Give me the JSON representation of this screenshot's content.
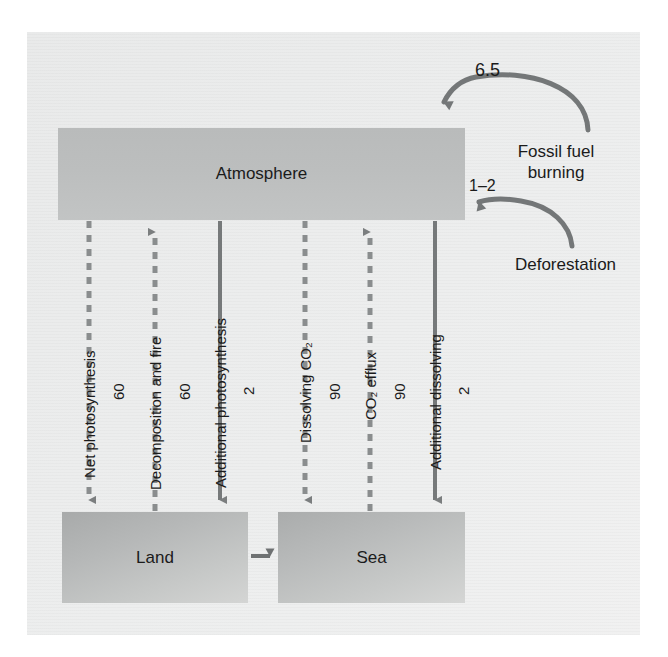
{
  "figure": {
    "type": "carbon-cycle-diagram",
    "background_color": "#eceded",
    "ink_color": "#6e7172",
    "text_color": "#1b1b1b"
  },
  "reservoirs": [
    {
      "id": "atmosphere",
      "label": "Atmosphere",
      "fill": "#bcbebe"
    },
    {
      "id": "land",
      "label": "Land",
      "fill": "#b8baba"
    },
    {
      "id": "sea",
      "label": "Sea",
      "fill": "#babcbc"
    }
  ],
  "flows": [
    {
      "id": "net-photosynthesis",
      "label": "Net photosynthesis",
      "value": "60",
      "direction": "down",
      "style": "dashed",
      "from": "atmosphere",
      "to": "land"
    },
    {
      "id": "decomposition-and-fire",
      "label": "Decomposition and fire",
      "value": "60",
      "direction": "up",
      "style": "dashed",
      "from": "land",
      "to": "atmosphere"
    },
    {
      "id": "additional-photosynthesis",
      "label": "Additional photosynthesis",
      "value": "2",
      "direction": "down",
      "style": "solid",
      "from": "atmosphere",
      "to": "land"
    },
    {
      "id": "dissolving-co2",
      "label": "Dissolving CO₂",
      "value": "90",
      "direction": "down",
      "style": "dashed",
      "from": "atmosphere",
      "to": "sea"
    },
    {
      "id": "co2-efflux",
      "label": "CO₂ efflux",
      "value": "90",
      "direction": "up",
      "style": "dashed",
      "from": "sea",
      "to": "atmosphere"
    },
    {
      "id": "additional-dissolving",
      "label": "Additional dissolving",
      "value": "2",
      "direction": "down",
      "style": "solid",
      "from": "atmosphere",
      "to": "sea"
    }
  ],
  "sources": [
    {
      "id": "fossil-fuel-burning",
      "label_line1": "Fossil fuel",
      "label_line2": "burning",
      "value": "6.5",
      "style": "solid",
      "to": "atmosphere"
    },
    {
      "id": "deforestation",
      "label_line1": "Deforestation",
      "label_line2": "",
      "value": "1–2",
      "style": "solid",
      "to": "atmosphere"
    }
  ],
  "land_to_sea": {
    "id": "land-to-sea-transfer",
    "label": "",
    "value": ""
  }
}
